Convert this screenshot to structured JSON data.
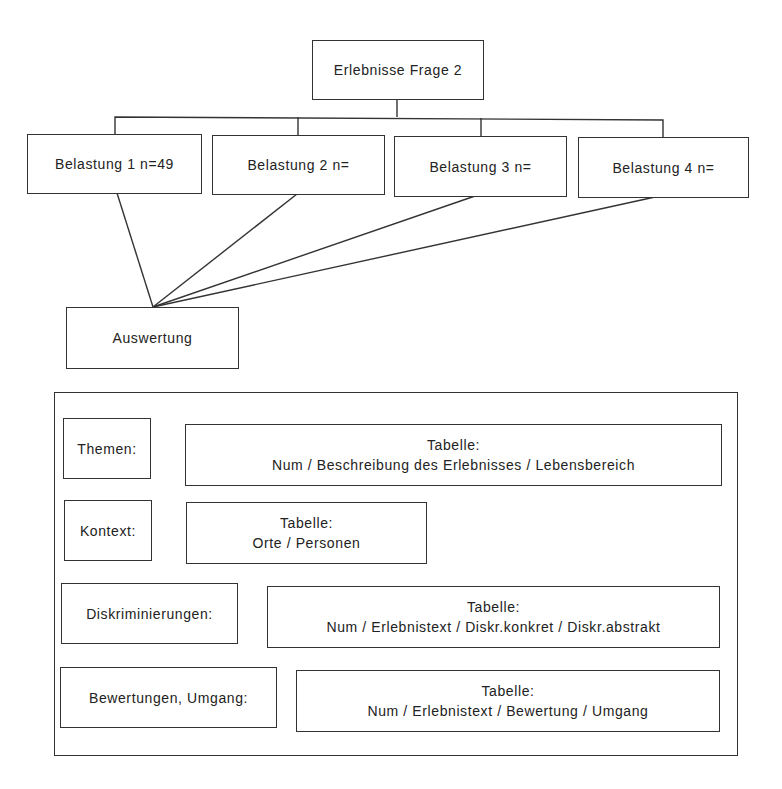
{
  "root": {
    "label": "Erlebnisse Frage 2"
  },
  "belastungen": [
    {
      "label": "Belastung 1 n=49"
    },
    {
      "label": "Belastung 2 n="
    },
    {
      "label": "Belastung 3 n="
    },
    {
      "label": "Belastung 4 n="
    }
  ],
  "auswertung": {
    "label": "Auswertung"
  },
  "categories": [
    {
      "label": "Themen:",
      "table_title": "Tabelle:",
      "table_columns": "Num / Beschreibung des Erlebnisses / Lebensbereich"
    },
    {
      "label": "Kontext:",
      "table_title": "Tabelle:",
      "table_columns": "Orte / Personen"
    },
    {
      "label": "Diskriminierungen:",
      "table_title": "Tabelle:",
      "table_columns": "Num / Erlebnistext / Diskr.konkret / Diskr.abstrakt"
    },
    {
      "label": "Bewertungen, Umgang:",
      "table_title": "Tabelle:",
      "table_columns": "Num / Erlebnistext / Bewertung / Umgang"
    }
  ],
  "colors": {
    "line": "#333333",
    "background": "#ffffff",
    "text": "#222222"
  }
}
